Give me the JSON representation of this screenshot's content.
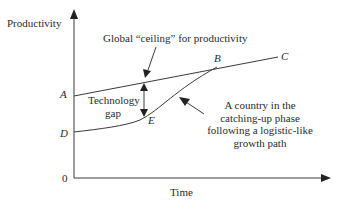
{
  "diagram": {
    "type": "conceptual growth diagram",
    "axes": {
      "y_label": "Productivity",
      "x_label": "Time",
      "origin_label": "0"
    },
    "points": {
      "A": "A",
      "B": "B",
      "C": "C",
      "D": "D",
      "E": "E"
    },
    "annotations": {
      "ceiling": "Global “ceiling” for productivity",
      "gap_line1": "Technology",
      "gap_line2": "gap",
      "catchup": "A country in the catching-up phase following a logistic-like growth path"
    },
    "curves": [
      {
        "name": "global-ceiling-line",
        "path": "A-B-C",
        "shape": "straight line, gently rising"
      },
      {
        "name": "catching-up-path",
        "path": "D-E-B",
        "shape": "logistic-like S-curve converging to ceiling at B"
      }
    ],
    "colors": {
      "line": "#3a3a3a",
      "text": "#2a2a2a",
      "background": "#ffffff"
    }
  }
}
